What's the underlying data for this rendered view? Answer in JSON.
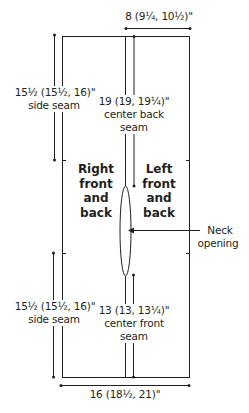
{
  "diagram": {
    "type": "garment schematic",
    "panels": {
      "right": "Right front and back",
      "left": "Left front and back"
    },
    "labels": {
      "top_width": "8 (9¼, 10½)\"",
      "upper_side_seam_value": "15½ (15½, 16)\"",
      "upper_side_seam_name": "side seam",
      "center_back_value": "19 (19, 19¼)\"",
      "center_back_name_1": "center back",
      "center_back_name_2": "seam",
      "right_panel_1": "Right",
      "right_panel_2": "front",
      "right_panel_3": "and",
      "right_panel_4": "back",
      "left_panel_1": "Left",
      "left_panel_2": "front",
      "left_panel_3": "and",
      "left_panel_4": "back",
      "neck_1": "Neck",
      "neck_2": "opening",
      "lower_side_seam_value": "15½ (15½, 16)\"",
      "lower_side_seam_name": "side seam",
      "center_front_value": "13 (13, 13¼)\"",
      "center_front_name_1": "center front",
      "center_front_name_2": "seam",
      "bottom_width": "16 (18½, 21)\""
    },
    "colors": {
      "line": "#231f20",
      "background": "#ffffff"
    }
  }
}
